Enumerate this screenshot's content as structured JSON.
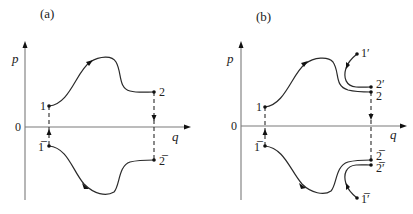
{
  "panels": [
    {
      "id": "a",
      "title": "(a)",
      "axes": {
        "y_label": "p",
        "x_label": "q",
        "origin_label": "0"
      },
      "points": {
        "p1": "1",
        "p2": "2",
        "p1bar": "1̅",
        "p2bar": "2̅"
      },
      "curves": [
        {
          "from": "1",
          "to": "2",
          "shape": "rises to a maximum then falls",
          "direction": "1 → 2"
        },
        {
          "from": "1̄",
          "to": "2̄",
          "shape": "falls to a minimum then rises",
          "direction": "1̄ → 2̄"
        }
      ],
      "connectors": [
        {
          "between": "1–1̄",
          "style": "dashed",
          "arrow": "up"
        },
        {
          "between": "2–2̄",
          "style": "dashed",
          "arrow": "down"
        }
      ]
    },
    {
      "id": "b",
      "title": "(b)",
      "axes": {
        "y_label": "p",
        "x_label": "q",
        "origin_label": "0"
      },
      "points": {
        "p1": "1",
        "p2": "2",
        "p2prime": "2′",
        "p1prime": "1′",
        "p1bar": "1̅",
        "p2bar": "2̅",
        "p2barprime": "2̅′",
        "p1barprime": "1̅′"
      },
      "curves": [
        {
          "from": "1",
          "to": "2",
          "shape": "rises to a maximum then falls"
        },
        {
          "from": "1′",
          "to": "2′",
          "shape": "hook curving down and right"
        },
        {
          "from": "1̄",
          "to": "2̄",
          "shape": "falls to a minimum then rises"
        },
        {
          "from": "1̄′",
          "to": "2̄′",
          "shape": "hook curving up and right"
        }
      ],
      "connectors": [
        {
          "between": "1–1̄",
          "style": "dashed",
          "arrow": "up"
        },
        {
          "between": "2–2̄",
          "style": "dashed",
          "arrow": "down"
        }
      ]
    }
  ]
}
